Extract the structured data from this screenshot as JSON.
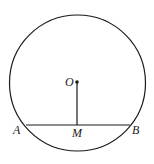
{
  "diagram": {
    "type": "geometry",
    "colors": {
      "stroke": "#1a1a1a",
      "background": "#ffffff"
    },
    "circle": {
      "cx": 77.5,
      "cy": 83,
      "r": 68
    },
    "points": {
      "O": {
        "label": "O",
        "x": 77,
        "y": 82
      },
      "A": {
        "label": "A",
        "x": 26,
        "y": 125
      },
      "M": {
        "label": "M",
        "x": 77,
        "y": 125
      },
      "B": {
        "label": "B",
        "x": 130,
        "y": 125
      }
    },
    "segments": [
      {
        "from": "A",
        "to": "B",
        "name": "chord-AB"
      },
      {
        "from": "O",
        "to": "M",
        "name": "segment-OM"
      }
    ]
  }
}
